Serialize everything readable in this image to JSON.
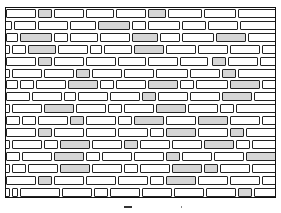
{
  "figure": {
    "rows": 16,
    "row_height": 11.9,
    "line_color": "#222222",
    "shade_color": "#d6d6d6",
    "layout": [
      [
        [
          0,
          30
        ],
        [
          32,
          14,
          1
        ],
        [
          48,
          30
        ],
        [
          80,
          28
        ],
        [
          110,
          30
        ],
        [
          142,
          18,
          1
        ],
        [
          162,
          34
        ],
        [
          198,
          32
        ],
        [
          232,
          40
        ]
      ],
      [
        [
          -6,
          12
        ],
        [
          8,
          22
        ],
        [
          32,
          30
        ],
        [
          64,
          26
        ],
        [
          92,
          32,
          1
        ],
        [
          126,
          14
        ],
        [
          142,
          32
        ],
        [
          176,
          24
        ],
        [
          202,
          30
        ],
        [
          234,
          40
        ]
      ],
      [
        [
          0,
          12
        ],
        [
          14,
          32,
          1
        ],
        [
          48,
          14
        ],
        [
          64,
          28
        ],
        [
          94,
          30
        ],
        [
          126,
          26,
          1
        ],
        [
          154,
          20
        ],
        [
          176,
          32
        ],
        [
          210,
          30,
          1
        ],
        [
          242,
          30
        ]
      ],
      [
        [
          -4,
          8
        ],
        [
          6,
          14
        ],
        [
          22,
          28,
          1
        ],
        [
          52,
          30
        ],
        [
          84,
          12
        ],
        [
          98,
          28
        ],
        [
          128,
          30,
          1
        ],
        [
          160,
          30
        ],
        [
          192,
          30
        ],
        [
          224,
          30
        ],
        [
          256,
          20
        ]
      ],
      [
        [
          0,
          30
        ],
        [
          32,
          14,
          1
        ],
        [
          48,
          30
        ],
        [
          80,
          30
        ],
        [
          112,
          28
        ],
        [
          142,
          30
        ],
        [
          174,
          28
        ],
        [
          206,
          14,
          1
        ],
        [
          222,
          30
        ],
        [
          254,
          20
        ]
      ],
      [
        [
          -4,
          8
        ],
        [
          6,
          30
        ],
        [
          38,
          30
        ],
        [
          70,
          14,
          1
        ],
        [
          86,
          30
        ],
        [
          118,
          30
        ],
        [
          150,
          32
        ],
        [
          184,
          30
        ],
        [
          216,
          14,
          1
        ],
        [
          232,
          40
        ]
      ],
      [
        [
          0,
          12
        ],
        [
          14,
          14
        ],
        [
          30,
          30
        ],
        [
          62,
          30,
          1
        ],
        [
          94,
          14
        ],
        [
          110,
          30
        ],
        [
          142,
          30,
          1
        ],
        [
          174,
          14
        ],
        [
          190,
          32
        ],
        [
          224,
          30,
          1
        ],
        [
          256,
          20
        ]
      ],
      [
        [
          0,
          24
        ],
        [
          26,
          30
        ],
        [
          58,
          12
        ],
        [
          72,
          30
        ],
        [
          104,
          30
        ],
        [
          136,
          14,
          1
        ],
        [
          152,
          30
        ],
        [
          184,
          30
        ],
        [
          216,
          30,
          1
        ],
        [
          248,
          24
        ]
      ],
      [
        [
          -4,
          8
        ],
        [
          6,
          30
        ],
        [
          38,
          30,
          1
        ],
        [
          70,
          30
        ],
        [
          102,
          14
        ],
        [
          118,
          30
        ],
        [
          150,
          30,
          1
        ],
        [
          182,
          30
        ],
        [
          214,
          14
        ],
        [
          230,
          42
        ]
      ],
      [
        [
          0,
          14
        ],
        [
          16,
          14
        ],
        [
          32,
          30
        ],
        [
          64,
          14,
          1
        ],
        [
          80,
          30
        ],
        [
          112,
          14
        ],
        [
          128,
          30,
          1
        ],
        [
          160,
          30
        ],
        [
          192,
          30,
          1
        ],
        [
          224,
          30
        ],
        [
          256,
          20
        ]
      ],
      [
        [
          0,
          30
        ],
        [
          32,
          14,
          1
        ],
        [
          48,
          30
        ],
        [
          80,
          30
        ],
        [
          112,
          30
        ],
        [
          144,
          14
        ],
        [
          160,
          30,
          1
        ],
        [
          192,
          30
        ],
        [
          224,
          14,
          1
        ],
        [
          240,
          32
        ]
      ],
      [
        [
          -4,
          8
        ],
        [
          6,
          30
        ],
        [
          38,
          14
        ],
        [
          54,
          30,
          1
        ],
        [
          86,
          30
        ],
        [
          118,
          14,
          1
        ],
        [
          134,
          30
        ],
        [
          166,
          30
        ],
        [
          198,
          30,
          1
        ],
        [
          230,
          14
        ],
        [
          246,
          26
        ]
      ],
      [
        [
          0,
          14
        ],
        [
          16,
          30
        ],
        [
          48,
          30,
          1
        ],
        [
          80,
          14
        ],
        [
          96,
          30
        ],
        [
          128,
          30
        ],
        [
          160,
          14,
          1
        ],
        [
          176,
          30
        ],
        [
          208,
          30
        ],
        [
          240,
          32,
          1
        ]
      ],
      [
        [
          -4,
          8
        ],
        [
          6,
          14
        ],
        [
          22,
          30
        ],
        [
          54,
          30,
          1
        ],
        [
          86,
          30
        ],
        [
          118,
          14
        ],
        [
          134,
          30
        ],
        [
          166,
          30,
          1
        ],
        [
          198,
          14,
          1
        ],
        [
          214,
          30
        ],
        [
          246,
          26
        ]
      ],
      [
        [
          0,
          30
        ],
        [
          32,
          14,
          1
        ],
        [
          48,
          30
        ],
        [
          80,
          30
        ],
        [
          112,
          30
        ],
        [
          144,
          14
        ],
        [
          160,
          30,
          1
        ],
        [
          192,
          30
        ],
        [
          224,
          30
        ],
        [
          256,
          20
        ]
      ],
      [
        [
          -4,
          8
        ],
        [
          6,
          6
        ],
        [
          14,
          40
        ],
        [
          56,
          30
        ],
        [
          88,
          14
        ],
        [
          104,
          30
        ],
        [
          136,
          30
        ],
        [
          168,
          30
        ],
        [
          200,
          30
        ],
        [
          232,
          14,
          1
        ],
        [
          248,
          24
        ]
      ]
    ]
  },
  "caption": {
    "mark_left": 124,
    "mark_width": 8,
    "dot_left": 181
  }
}
